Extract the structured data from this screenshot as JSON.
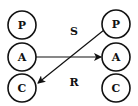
{
  "diagram": {
    "left_nodes": [
      {
        "id": "P",
        "label": "P",
        "cx": 22,
        "cy": 25
      },
      {
        "id": "A",
        "label": "A",
        "cx": 22,
        "cy": 57
      },
      {
        "id": "C",
        "label": "C",
        "cx": 22,
        "cy": 88
      }
    ],
    "right_nodes": [
      {
        "id": "P",
        "label": "P",
        "cx": 116,
        "cy": 24
      },
      {
        "id": "A",
        "label": "A",
        "cx": 116,
        "cy": 57
      },
      {
        "id": "C",
        "label": "C",
        "cx": 116,
        "cy": 88
      }
    ],
    "labels": {
      "top": "S",
      "bottom": "R"
    },
    "edges": [
      {
        "from": "left.A",
        "to": "right.A"
      },
      {
        "from": "right.P",
        "to": "left.C"
      }
    ],
    "colors": {
      "stroke": "#111111",
      "fill": "#ffffff"
    }
  }
}
